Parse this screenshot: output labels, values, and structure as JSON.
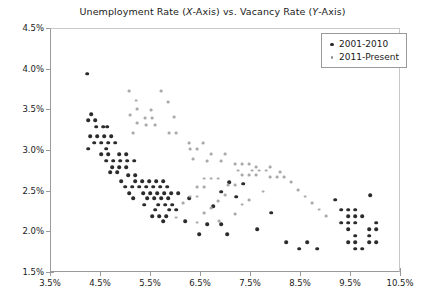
{
  "chart_data": {
    "type": "scatter",
    "title": "Unemployment Rate (X-Axis) vs. Vacancy Rate (Y-Axis)",
    "title_parts": {
      "pre": "Unemployment Rate (",
      "ital1": "X",
      "mid": "-Axis) vs. Vacancy Rate (",
      "ital2": "Y",
      "post": "-Axis)"
    },
    "xlabel": "",
    "ylabel": "",
    "xlim": [
      3.5,
      10.5
    ],
    "ylim": [
      1.5,
      4.5
    ],
    "xticks": [
      "3.5%",
      "4.5%",
      "5.5%",
      "6.5%",
      "7.5%",
      "8.5%",
      "9.5%",
      "10.5%"
    ],
    "xtick_values": [
      3.5,
      4.5,
      5.5,
      6.5,
      7.5,
      8.5,
      9.5,
      10.5
    ],
    "yticks": [
      "1.5%",
      "2.0%",
      "2.5%",
      "3.0%",
      "3.5%",
      "4.0%",
      "4.5%"
    ],
    "ytick_values": [
      1.5,
      2.0,
      2.5,
      3.0,
      3.5,
      4.0,
      4.5
    ],
    "grid": false,
    "legend_position": "top-right",
    "colors": {
      "series_2001_2010": "#2b2b2b",
      "series_2011_present": "#a9a9a9",
      "axis": "#9a9a9a",
      "text": "#1a1a1a",
      "background": "#ffffff"
    },
    "series": [
      {
        "name": "2001-2010",
        "color": "#2b2b2b",
        "marker": "circle",
        "points": [
          [
            4.22,
            3.95
          ],
          [
            4.3,
            3.45
          ],
          [
            4.24,
            3.38
          ],
          [
            4.38,
            3.38
          ],
          [
            4.4,
            3.3
          ],
          [
            4.54,
            3.3
          ],
          [
            4.62,
            3.3
          ],
          [
            4.28,
            3.18
          ],
          [
            4.42,
            3.18
          ],
          [
            4.56,
            3.18
          ],
          [
            4.7,
            3.18
          ],
          [
            4.36,
            3.1
          ],
          [
            4.5,
            3.1
          ],
          [
            4.64,
            3.1
          ],
          [
            4.78,
            3.1
          ],
          [
            4.24,
            3.03
          ],
          [
            4.6,
            3.03
          ],
          [
            4.5,
            2.96
          ],
          [
            4.64,
            2.96
          ],
          [
            4.86,
            2.96
          ],
          [
            5.0,
            2.96
          ],
          [
            4.6,
            2.88
          ],
          [
            4.74,
            2.88
          ],
          [
            4.88,
            2.88
          ],
          [
            5.02,
            2.88
          ],
          [
            5.16,
            2.88
          ],
          [
            4.72,
            2.8
          ],
          [
            4.86,
            2.8
          ],
          [
            5.0,
            2.8
          ],
          [
            4.68,
            2.74
          ],
          [
            4.82,
            2.74
          ],
          [
            5.04,
            2.7
          ],
          [
            5.18,
            2.7
          ],
          [
            4.9,
            2.63
          ],
          [
            5.18,
            2.63
          ],
          [
            5.32,
            2.63
          ],
          [
            5.46,
            2.63
          ],
          [
            5.6,
            2.63
          ],
          [
            5.74,
            2.63
          ],
          [
            4.98,
            2.56
          ],
          [
            5.12,
            2.56
          ],
          [
            5.26,
            2.56
          ],
          [
            5.4,
            2.56
          ],
          [
            5.54,
            2.56
          ],
          [
            5.68,
            2.56
          ],
          [
            5.82,
            2.56
          ],
          [
            5.06,
            2.48
          ],
          [
            5.34,
            2.48
          ],
          [
            5.48,
            2.48
          ],
          [
            5.62,
            2.48
          ],
          [
            5.76,
            2.48
          ],
          [
            5.9,
            2.48
          ],
          [
            6.04,
            2.48
          ],
          [
            5.14,
            2.42
          ],
          [
            5.42,
            2.42
          ],
          [
            5.56,
            2.42
          ],
          [
            5.7,
            2.42
          ],
          [
            5.84,
            2.42
          ],
          [
            6.26,
            2.42
          ],
          [
            5.36,
            2.34
          ],
          [
            5.64,
            2.34
          ],
          [
            5.78,
            2.34
          ],
          [
            5.92,
            2.34
          ],
          [
            5.58,
            2.28
          ],
          [
            5.86,
            2.28
          ],
          [
            6.0,
            2.28
          ],
          [
            5.52,
            2.2
          ],
          [
            5.66,
            2.2
          ],
          [
            5.8,
            2.2
          ],
          [
            5.74,
            2.14
          ],
          [
            6.18,
            2.14
          ],
          [
            6.62,
            2.1
          ],
          [
            6.9,
            2.1
          ],
          [
            6.46,
            1.98
          ],
          [
            7.02,
            1.98
          ],
          [
            8.46,
            1.8
          ],
          [
            8.82,
            1.8
          ],
          [
            9.3,
            2.28
          ],
          [
            9.44,
            2.28
          ],
          [
            9.58,
            2.28
          ],
          [
            9.44,
            2.2
          ],
          [
            9.58,
            2.2
          ],
          [
            9.72,
            2.2
          ],
          [
            9.3,
            2.12
          ],
          [
            9.44,
            2.12
          ],
          [
            9.58,
            2.12
          ],
          [
            10.0,
            2.12
          ],
          [
            9.44,
            2.04
          ],
          [
            9.86,
            2.04
          ],
          [
            10.0,
            2.04
          ],
          [
            9.58,
            1.96
          ],
          [
            9.86,
            1.96
          ],
          [
            9.44,
            1.88
          ],
          [
            9.58,
            1.88
          ],
          [
            9.86,
            1.88
          ],
          [
            10.0,
            1.88
          ],
          [
            9.58,
            1.8
          ],
          [
            9.72,
            1.8
          ],
          [
            8.2,
            1.88
          ],
          [
            8.62,
            1.88
          ],
          [
            7.62,
            2.04
          ],
          [
            7.9,
            2.24
          ],
          [
            9.18,
            2.4
          ],
          [
            9.88,
            2.46
          ],
          [
            6.74,
            2.32
          ],
          [
            7.06,
            2.62
          ],
          [
            7.34,
            2.6
          ],
          [
            6.9,
            2.5
          ],
          [
            7.2,
            2.44
          ]
        ]
      },
      {
        "name": "2011-Present",
        "color": "#a9a9a9",
        "marker": "circle",
        "points": [
          [
            5.06,
            3.74
          ],
          [
            5.7,
            3.74
          ],
          [
            5.2,
            3.62
          ],
          [
            5.84,
            3.6
          ],
          [
            5.22,
            3.52
          ],
          [
            5.5,
            3.5
          ],
          [
            5.08,
            3.44
          ],
          [
            5.38,
            3.4
          ],
          [
            5.52,
            3.4
          ],
          [
            5.96,
            3.42
          ],
          [
            5.22,
            3.34
          ],
          [
            5.4,
            3.32
          ],
          [
            5.58,
            3.32
          ],
          [
            5.14,
            3.22
          ],
          [
            5.86,
            3.22
          ],
          [
            6.0,
            3.22
          ],
          [
            6.26,
            3.1
          ],
          [
            6.54,
            3.1
          ],
          [
            6.28,
            3.02
          ],
          [
            6.42,
            3.02
          ],
          [
            6.7,
            2.96
          ],
          [
            6.98,
            2.96
          ],
          [
            6.34,
            2.9
          ],
          [
            6.62,
            2.88
          ],
          [
            6.9,
            2.88
          ],
          [
            7.18,
            2.84
          ],
          [
            7.32,
            2.84
          ],
          [
            7.46,
            2.84
          ],
          [
            7.6,
            2.8
          ],
          [
            7.88,
            2.8
          ],
          [
            7.24,
            2.76
          ],
          [
            7.52,
            2.76
          ],
          [
            7.66,
            2.76
          ],
          [
            7.8,
            2.76
          ],
          [
            8.08,
            2.74
          ],
          [
            7.32,
            2.7
          ],
          [
            7.46,
            2.7
          ],
          [
            7.6,
            2.7
          ],
          [
            7.88,
            2.68
          ],
          [
            8.02,
            2.68
          ],
          [
            8.16,
            2.68
          ],
          [
            6.56,
            2.66
          ],
          [
            6.7,
            2.66
          ],
          [
            6.84,
            2.66
          ],
          [
            8.3,
            2.62
          ],
          [
            7.04,
            2.58
          ],
          [
            7.18,
            2.58
          ],
          [
            6.42,
            2.56
          ],
          [
            6.56,
            2.56
          ],
          [
            8.44,
            2.52
          ],
          [
            7.74,
            2.5
          ],
          [
            6.98,
            2.46
          ],
          [
            8.58,
            2.44
          ],
          [
            6.28,
            2.44
          ],
          [
            6.42,
            2.44
          ],
          [
            7.46,
            2.4
          ],
          [
            6.84,
            2.38
          ],
          [
            8.72,
            2.36
          ],
          [
            6.14,
            2.36
          ],
          [
            7.32,
            2.34
          ],
          [
            6.7,
            2.3
          ],
          [
            8.86,
            2.28
          ],
          [
            6.56,
            2.24
          ],
          [
            7.18,
            2.22
          ],
          [
            6.0,
            2.18
          ],
          [
            9.0,
            2.2
          ],
          [
            6.86,
            2.14
          ],
          [
            6.42,
            2.12
          ]
        ]
      }
    ]
  },
  "legend": {
    "items": [
      {
        "label": "2001-2010"
      },
      {
        "label": "2011-Present"
      }
    ]
  }
}
